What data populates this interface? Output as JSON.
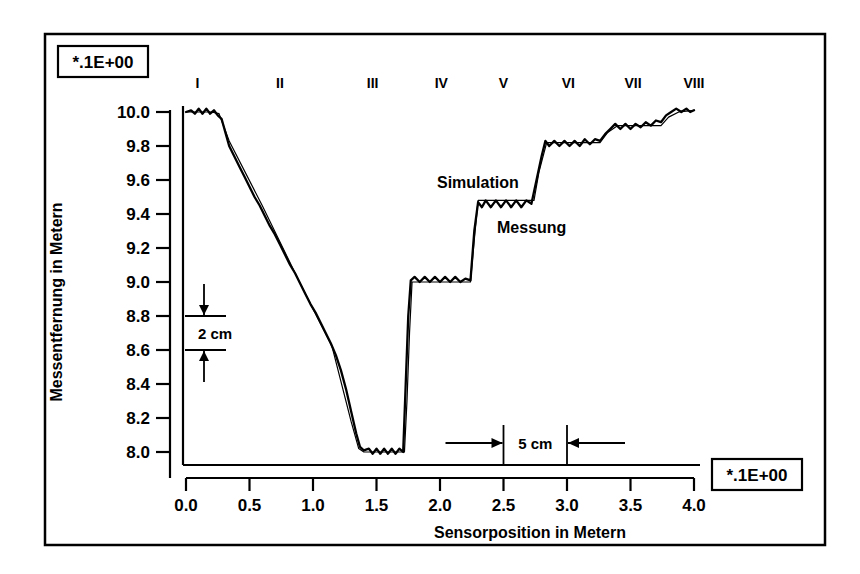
{
  "figure": {
    "frame": {
      "visible": true,
      "color": "#000000"
    },
    "background": "#ffffff",
    "exponent_box_top": "*.1E+00",
    "exponent_box_bottom": "*.1E+00"
  },
  "annotations": {
    "vertical_scale_label": "2 cm",
    "horizontal_scale_label": "5 cm",
    "curve_label_simulation": "Simulation",
    "curve_label_messung": "Messung"
  },
  "chart_data": {
    "type": "line",
    "title": "",
    "xlabel": "Sensorposition  in  Metern",
    "ylabel": "Messentfernung  in  Metern",
    "xlim": [
      0.0,
      4.0
    ],
    "ylim": [
      8.0,
      10.0
    ],
    "grid": false,
    "legend_position": "inline-annotation",
    "xticks": [
      "0.0",
      "0.5",
      "1.0",
      "1.5",
      "2.0",
      "2.5",
      "3.0",
      "3.5",
      "4.0"
    ],
    "xtick_values": [
      0.0,
      0.5,
      1.0,
      1.5,
      2.0,
      2.5,
      3.0,
      3.5,
      4.0
    ],
    "yticks": [
      "8.0",
      "8.2",
      "8.4",
      "8.6",
      "8.8",
      "9.0",
      "9.2",
      "9.4",
      "9.6",
      "9.8",
      "10.0"
    ],
    "ytick_values": [
      8.0,
      8.2,
      8.4,
      8.6,
      8.8,
      9.0,
      9.2,
      9.4,
      9.6,
      9.8,
      10.0
    ],
    "x_axis_multiplier": "*.1E+00",
    "y_axis_multiplier": "*.1E+00",
    "section_markers": [
      {
        "label": "I",
        "x": 0.09
      },
      {
        "label": "II",
        "x": 0.74
      },
      {
        "label": "III",
        "x": 1.47
      },
      {
        "label": "IV",
        "x": 2.01
      },
      {
        "label": "V",
        "x": 2.5
      },
      {
        "label": "VI",
        "x": 3.01
      },
      {
        "label": "VII",
        "x": 3.52
      },
      {
        "label": "VIII",
        "x": 4.0
      }
    ],
    "series": [
      {
        "name": "Simulation",
        "style": "smooth-thin",
        "points": [
          [
            0.0,
            10.0
          ],
          [
            0.2,
            10.0
          ],
          [
            0.26,
            9.99
          ],
          [
            0.34,
            9.83
          ],
          [
            0.6,
            9.45
          ],
          [
            0.9,
            8.99
          ],
          [
            1.15,
            8.62
          ],
          [
            1.3,
            8.18
          ],
          [
            1.36,
            8.02
          ],
          [
            1.4,
            8.0
          ],
          [
            1.72,
            8.0
          ],
          [
            1.74,
            8.3
          ],
          [
            1.76,
            8.7
          ],
          [
            1.78,
            9.0
          ],
          [
            2.24,
            9.0
          ],
          [
            2.27,
            9.25
          ],
          [
            2.3,
            9.48
          ],
          [
            2.74,
            9.48
          ],
          [
            2.78,
            9.65
          ],
          [
            2.84,
            9.82
          ],
          [
            3.26,
            9.82
          ],
          [
            3.32,
            9.88
          ],
          [
            3.4,
            9.92
          ],
          [
            3.74,
            9.92
          ],
          [
            3.8,
            9.97
          ],
          [
            3.88,
            10.0
          ],
          [
            4.0,
            10.01
          ]
        ]
      },
      {
        "name": "Messung",
        "style": "noisy-thick",
        "points": [
          [
            0.0,
            10.0
          ],
          [
            0.04,
            10.01
          ],
          [
            0.07,
            9.99
          ],
          [
            0.1,
            10.02
          ],
          [
            0.13,
            9.99
          ],
          [
            0.16,
            10.02
          ],
          [
            0.19,
            9.99
          ],
          [
            0.22,
            10.01
          ],
          [
            0.25,
            9.98
          ],
          [
            0.28,
            9.96
          ],
          [
            0.31,
            9.88
          ],
          [
            0.34,
            9.8
          ],
          [
            0.38,
            9.74
          ],
          [
            0.42,
            9.68
          ],
          [
            0.46,
            9.62
          ],
          [
            0.5,
            9.56
          ],
          [
            0.54,
            9.5
          ],
          [
            0.58,
            9.45
          ],
          [
            0.62,
            9.39
          ],
          [
            0.66,
            9.33
          ],
          [
            0.7,
            9.28
          ],
          [
            0.74,
            9.22
          ],
          [
            0.78,
            9.16
          ],
          [
            0.82,
            9.1
          ],
          [
            0.86,
            9.05
          ],
          [
            0.9,
            8.99
          ],
          [
            0.94,
            8.93
          ],
          [
            0.98,
            8.87
          ],
          [
            1.02,
            8.82
          ],
          [
            1.06,
            8.76
          ],
          [
            1.1,
            8.7
          ],
          [
            1.14,
            8.64
          ],
          [
            1.18,
            8.57
          ],
          [
            1.22,
            8.48
          ],
          [
            1.26,
            8.37
          ],
          [
            1.3,
            8.24
          ],
          [
            1.34,
            8.11
          ],
          [
            1.37,
            8.03
          ],
          [
            1.4,
            8.01
          ],
          [
            1.44,
            8.02
          ],
          [
            1.47,
            7.99
          ],
          [
            1.5,
            8.02
          ],
          [
            1.53,
            7.99
          ],
          [
            1.56,
            8.02
          ],
          [
            1.59,
            7.99
          ],
          [
            1.62,
            8.02
          ],
          [
            1.65,
            7.99
          ],
          [
            1.68,
            8.02
          ],
          [
            1.71,
            8.0
          ],
          [
            1.73,
            8.4
          ],
          [
            1.75,
            8.8
          ],
          [
            1.77,
            9.01
          ],
          [
            1.8,
            9.03
          ],
          [
            1.84,
            9.0
          ],
          [
            1.88,
            9.03
          ],
          [
            1.92,
            9.0
          ],
          [
            1.96,
            9.03
          ],
          [
            2.0,
            9.0
          ],
          [
            2.04,
            9.03
          ],
          [
            2.08,
            9.0
          ],
          [
            2.12,
            9.03
          ],
          [
            2.16,
            9.0
          ],
          [
            2.2,
            9.02
          ],
          [
            2.24,
            9.01
          ],
          [
            2.27,
            9.3
          ],
          [
            2.3,
            9.47
          ],
          [
            2.33,
            9.44
          ],
          [
            2.36,
            9.48
          ],
          [
            2.4,
            9.44
          ],
          [
            2.44,
            9.48
          ],
          [
            2.48,
            9.44
          ],
          [
            2.52,
            9.48
          ],
          [
            2.56,
            9.44
          ],
          [
            2.6,
            9.48
          ],
          [
            2.64,
            9.44
          ],
          [
            2.68,
            9.48
          ],
          [
            2.72,
            9.46
          ],
          [
            2.76,
            9.6
          ],
          [
            2.8,
            9.74
          ],
          [
            2.83,
            9.83
          ],
          [
            2.86,
            9.8
          ],
          [
            2.9,
            9.83
          ],
          [
            2.94,
            9.8
          ],
          [
            2.98,
            9.83
          ],
          [
            3.02,
            9.8
          ],
          [
            3.06,
            9.83
          ],
          [
            3.1,
            9.8
          ],
          [
            3.14,
            9.84
          ],
          [
            3.18,
            9.81
          ],
          [
            3.22,
            9.84
          ],
          [
            3.26,
            9.83
          ],
          [
            3.3,
            9.87
          ],
          [
            3.34,
            9.9
          ],
          [
            3.38,
            9.93
          ],
          [
            3.42,
            9.9
          ],
          [
            3.46,
            9.93
          ],
          [
            3.5,
            9.9
          ],
          [
            3.54,
            9.93
          ],
          [
            3.58,
            9.91
          ],
          [
            3.62,
            9.94
          ],
          [
            3.66,
            9.92
          ],
          [
            3.7,
            9.95
          ],
          [
            3.74,
            9.94
          ],
          [
            3.78,
            9.98
          ],
          [
            3.82,
            10.0
          ],
          [
            3.86,
            10.02
          ],
          [
            3.9,
            10.0
          ],
          [
            3.94,
            10.02
          ],
          [
            3.97,
            10.0
          ],
          [
            4.0,
            10.01
          ]
        ]
      }
    ],
    "scale_bars": [
      {
        "label": "2 cm",
        "orientation": "vertical",
        "x": 0.0,
        "y_from": 8.6,
        "y_to": 8.8
      },
      {
        "label": "5 cm",
        "orientation": "horizontal",
        "y": 8.0,
        "x_from": 2.5,
        "x_to": 3.0
      }
    ]
  }
}
